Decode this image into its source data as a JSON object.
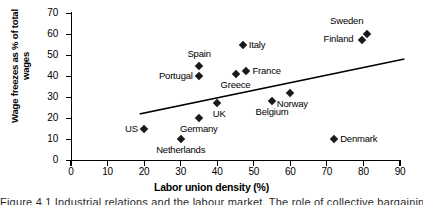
{
  "chart_data": {
    "type": "scatter",
    "title": "",
    "xlabel": "Labor union density (%)",
    "ylabel": "Wage freezes as % of total wages",
    "xlim": [
      0,
      90
    ],
    "ylim": [
      0,
      70
    ],
    "xticks": [
      0,
      10,
      20,
      30,
      40,
      50,
      60,
      70,
      80,
      90
    ],
    "yticks": [
      0,
      10,
      20,
      30,
      40,
      50,
      60,
      70
    ],
    "grid": false,
    "legend": "none",
    "marker_style": "filled-diamond",
    "marker_color": "#1a1a1a",
    "points": [
      {
        "label": "US",
        "x": 20,
        "y": 15,
        "label_pos": "left"
      },
      {
        "label": "Netherlands",
        "x": 30,
        "y": 10,
        "label_pos": "below"
      },
      {
        "label": "Germany",
        "x": 35,
        "y": 20,
        "label_pos": "below"
      },
      {
        "label": "Portugal",
        "x": 35,
        "y": 40,
        "label_pos": "left"
      },
      {
        "label": "Spain",
        "x": 35,
        "y": 45,
        "label_pos": "above"
      },
      {
        "label": "UK",
        "x": 40,
        "y": 27,
        "label_pos": "below-right"
      },
      {
        "label": "Greece",
        "x": 45,
        "y": 41,
        "label_pos": "below"
      },
      {
        "label": "Italy",
        "x": 47,
        "y": 55,
        "label_pos": "right"
      },
      {
        "label": "France",
        "x": 48,
        "y": 42.5,
        "label_pos": "right"
      },
      {
        "label": "Belgium",
        "x": 55,
        "y": 28,
        "label_pos": "below"
      },
      {
        "label": "Norway",
        "x": 60,
        "y": 32,
        "label_pos": "below-right"
      },
      {
        "label": "Denmark",
        "x": 72,
        "y": 10,
        "label_pos": "right"
      },
      {
        "label": "Finland",
        "x": 79.5,
        "y": 57,
        "label_pos": "left-above"
      },
      {
        "label": "Sweden",
        "x": 81,
        "y": 60,
        "label_pos": "above-left"
      }
    ],
    "trendline": {
      "type": "linear",
      "x_start": 19,
      "y_start": 22,
      "x_end": 91,
      "y_end": 48,
      "color": "#000000"
    }
  },
  "caption": {
    "fragment": "Figure 4.1   Industrial relations and the labour market.   The role of collective bargaining"
  }
}
